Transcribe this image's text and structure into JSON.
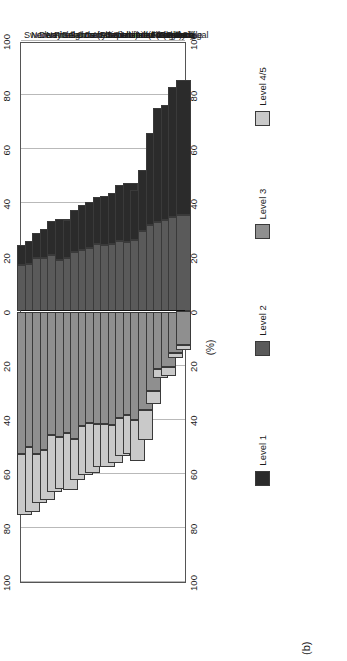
{
  "figure": {
    "panel_label": "(b)",
    "axis_title": "(%)"
  },
  "legend": {
    "items": [
      {
        "label": "Level 1",
        "color": "#2b2b2b"
      },
      {
        "label": "Level 2",
        "color": "#5a5a5a"
      },
      {
        "label": "Level 3",
        "color": "#8f8f8f"
      },
      {
        "label": "Level 4/5",
        "color": "#c9c9c9"
      }
    ]
  },
  "chart_data": {
    "type": "bar",
    "subtype": "diverging-stacked-horizontal",
    "title": "",
    "xlabel": "(%)",
    "ylabel": "",
    "xlim": [
      -100,
      100
    ],
    "xticks": [
      -100,
      -80,
      -60,
      -40,
      -20,
      0,
      20,
      40,
      60,
      80,
      100
    ],
    "xtick_labels": [
      "100",
      "80",
      "60",
      "40",
      "20",
      "0",
      "20",
      "40",
      "60",
      "80",
      "100"
    ],
    "grid": true,
    "legend_position": "right",
    "note": "Negative side of zero shows Level 3 and Level 4/5; positive side shows Level 2 and Level 1.",
    "categories": [
      "Sweden",
      "Norway",
      "Denmark",
      "Netherlands",
      "Finland",
      "Belgium (Flanders)",
      "Germany",
      "Czech Republic",
      "Canada",
      "Australia",
      "Switzerland (French)",
      "Switzerland (German)",
      "Switzerland (Italian)",
      "United States",
      "United Kingdom",
      "New Zealand",
      "Ireland",
      "Hungary",
      "Slovenia",
      "Poland",
      "Portugal",
      "Chile"
    ],
    "series": [
      {
        "name": "Level 1",
        "color": "#2b2b2b",
        "direction": "positive",
        "values": [
          7.5,
          8.6,
          9.6,
          10.5,
          12.6,
          15.3,
          14.4,
          15.7,
          16.6,
          17.0,
          17.6,
          17.9,
          19.0,
          20.7,
          21.8,
          18.4,
          22.6,
          33.8,
          42.2,
          42.6,
          48.0,
          50.1
        ]
      },
      {
        "name": "Level 2",
        "color": "#5a5a5a",
        "direction": "positive",
        "values": [
          17.1,
          17.4,
          19.6,
          19.9,
          20.8,
          18.9,
          19.6,
          22.0,
          22.8,
          23.3,
          24.8,
          24.7,
          24.9,
          25.9,
          25.7,
          26.4,
          29.8,
          32.1,
          33.2,
          33.7,
          34.9,
          35.6
        ]
      },
      {
        "name": "Level 3",
        "color": "#8f8f8f",
        "direction": "negative",
        "values": [
          52.6,
          50.2,
          52.6,
          51.3,
          45.8,
          46.3,
          44.9,
          47.1,
          42.4,
          41.2,
          41.6,
          41.5,
          41.9,
          39.4,
          38.4,
          40.0,
          36.3,
          29.5,
          21.4,
          20.4,
          15.3,
          12.5
        ]
      },
      {
        "name": "Level 4/5",
        "color": "#c9c9c9",
        "direction": "negative",
        "values": [
          22.8,
          23.8,
          18.2,
          18.3,
          20.8,
          19.5,
          21.1,
          15.2,
          18.2,
          18.5,
          16.0,
          15.9,
          14.2,
          14.0,
          14.1,
          15.2,
          11.3,
          4.6,
          3.2,
          3.3,
          1.8,
          1.8
        ]
      }
    ]
  }
}
